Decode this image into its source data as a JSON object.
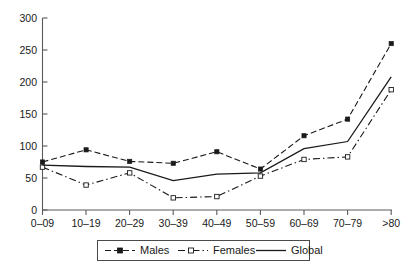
{
  "chart_data": {
    "type": "line",
    "title": "",
    "subtitle": "",
    "xlabel": "",
    "ylabel": "",
    "categories": [
      "0–09",
      "10–19",
      "20–29",
      "30–39",
      "40–49",
      "50–59",
      "60–69",
      "70–79",
      ">80"
    ],
    "series": [
      {
        "name": "Males",
        "values": [
          75,
          94,
          76,
          73,
          91,
          64,
          116,
          142,
          260
        ],
        "marker": "filled-square",
        "linestyle": "dashed",
        "color": "#1a1a1a"
      },
      {
        "name": "Females",
        "values": [
          67,
          39,
          58,
          19,
          21,
          53,
          79,
          83,
          188
        ],
        "marker": "open-square",
        "linestyle": "dash-dot",
        "color": "#1a1a1a"
      },
      {
        "name": "Global",
        "values": [
          70,
          68,
          67,
          46,
          56,
          58,
          96,
          107,
          208
        ],
        "marker": "none",
        "linestyle": "solid",
        "color": "#1a1a1a"
      }
    ],
    "ylim": [
      0,
      300
    ],
    "yticks": [
      0,
      50,
      100,
      150,
      200,
      250,
      300
    ],
    "ytick_labels": [
      "0",
      "50",
      "100",
      "150",
      "200",
      "250",
      "300"
    ],
    "grid": false,
    "legend_position": "bottom"
  },
  "axes": {
    "y_tick_labels": [
      "300",
      "250",
      "200",
      "150",
      "100",
      "50",
      "0"
    ],
    "x_tick_labels": [
      "0–09",
      "10–19",
      "20–29",
      "30–39",
      "40–49",
      "50–59",
      "60–69",
      "70–79",
      ">80"
    ]
  },
  "legend": {
    "items": [
      {
        "label": "Males",
        "marker": "filled-square"
      },
      {
        "label": "Females",
        "marker": "open-square"
      },
      {
        "label": "Global",
        "marker": "none"
      }
    ]
  }
}
